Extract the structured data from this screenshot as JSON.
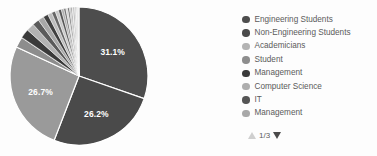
{
  "chart_data": {
    "type": "pie",
    "title": "",
    "legend_position": "right",
    "labels": [
      "Engineering Students",
      "Non-Engineering Students",
      "Academicians",
      "Student",
      "Management",
      "Computer Science",
      "IT",
      "Management"
    ],
    "visible_value_labels": [
      "31.1%",
      "26.2%",
      "26.7%"
    ],
    "slices": [
      {
        "label": "Engineering Students",
        "value": 31.1,
        "display": "31.1%",
        "color": "#4d4d4d",
        "show_label": true
      },
      {
        "label": "Non-Engineering Students",
        "value": 26.2,
        "display": "26.2%",
        "color": "#4a4a4a",
        "show_label": true
      },
      {
        "label": "Academicians",
        "value": 26.7,
        "display": "26.7%",
        "color": "#9a9a9a",
        "show_label": true
      },
      {
        "label": "Student",
        "value": 2.6,
        "display": "",
        "color": "#8d8d8d",
        "show_label": false
      },
      {
        "label": "Management",
        "value": 2.2,
        "display": "",
        "color": "#3a3a3a",
        "show_label": false
      },
      {
        "label": "Computer Science",
        "value": 1.9,
        "display": "",
        "color": "#b3b3b3",
        "show_label": false
      },
      {
        "label": "IT",
        "value": 1.6,
        "display": "",
        "color": "#5a5a5a",
        "show_label": false
      },
      {
        "label": "Management",
        "value": 1.4,
        "display": "",
        "color": "#a8a8a8",
        "show_label": false
      },
      {
        "label": "",
        "value": 1.2,
        "display": "",
        "color": "#404040",
        "show_label": false
      },
      {
        "label": "",
        "value": 1.0,
        "display": "",
        "color": "#bdbdbd",
        "show_label": false
      },
      {
        "label": "",
        "value": 0.9,
        "display": "",
        "color": "#676767",
        "show_label": false
      },
      {
        "label": "",
        "value": 0.8,
        "display": "",
        "color": "#c9c9c9",
        "show_label": false
      },
      {
        "label": "",
        "value": 0.7,
        "display": "",
        "color": "#555555",
        "show_label": false
      },
      {
        "label": "",
        "value": 0.6,
        "display": "",
        "color": "#aeaeae",
        "show_label": false
      },
      {
        "label": "",
        "value": 0.5,
        "display": "",
        "color": "#737373",
        "show_label": false
      },
      {
        "label": "",
        "value": 0.45,
        "display": "",
        "color": "#d2d2d2",
        "show_label": false
      },
      {
        "label": "",
        "value": 0.4,
        "display": "",
        "color": "#606060",
        "show_label": false
      },
      {
        "label": "",
        "value": 0.35,
        "display": "",
        "color": "#bababa",
        "show_label": false
      },
      {
        "label": "",
        "value": 0.3,
        "display": "",
        "color": "#7d7d7d",
        "show_label": false
      },
      {
        "label": "",
        "value": 0.28,
        "display": "",
        "color": "#d8d8d8",
        "show_label": false
      },
      {
        "label": "",
        "value": 0.25,
        "display": "",
        "color": "#6b6b6b",
        "show_label": false
      },
      {
        "label": "",
        "value": 0.22,
        "display": "",
        "color": "#c4c4c4",
        "show_label": false
      },
      {
        "label": "",
        "value": 0.2,
        "display": "",
        "color": "#888888",
        "show_label": false
      },
      {
        "label": "",
        "value": 0.18,
        "display": "",
        "color": "#dddddd",
        "show_label": false
      },
      {
        "label": "",
        "value": 0.16,
        "display": "",
        "color": "#707070",
        "show_label": false
      },
      {
        "label": "",
        "value": 0.14,
        "display": "",
        "color": "#cccccc",
        "show_label": false
      },
      {
        "label": "",
        "value": 0.12,
        "display": "",
        "color": "#959595",
        "show_label": false
      },
      {
        "label": "",
        "value": 0.1,
        "display": "",
        "color": "#e2e2e2",
        "show_label": false
      }
    ]
  },
  "legend": {
    "items": [
      {
        "label": "Engineering Students",
        "color": "#4d4d4d"
      },
      {
        "label": "Non-Engineering Students",
        "color": "#4a4a4a"
      },
      {
        "label": "Academicians",
        "color": "#b3b3b3"
      },
      {
        "label": "Student",
        "color": "#8d8d8d"
      },
      {
        "label": "Management",
        "color": "#3a3a3a"
      },
      {
        "label": "Computer Science",
        "color": "#aeaeae"
      },
      {
        "label": "IT",
        "color": "#555555"
      },
      {
        "label": "Management",
        "color": "#a8a8a8"
      }
    ]
  },
  "pager": {
    "label": "1/3",
    "up_icon": "triangle-up-icon",
    "down_icon": "triangle-down-icon"
  }
}
